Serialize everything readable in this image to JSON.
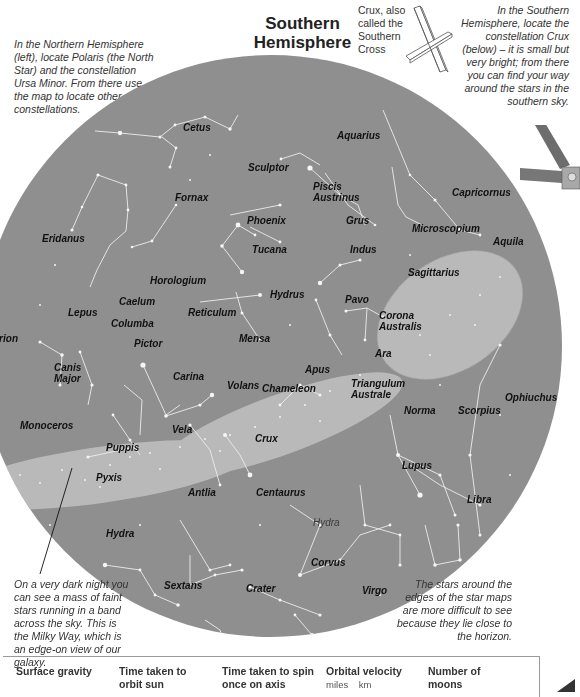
{
  "page": {
    "title": "Southern Hemisphere",
    "intro_left": "In the Northern Hemisphere (left), locate Polaris (the North Star) and the constellation Ursa Minor. From there use the map to locate other constellations.",
    "crux_caption": "Crux, also called the Southern Cross",
    "intro_right": "In the Southern Hemisphere, locate the constellation Crux (below) – it is small but very bright; from there you can find your way around the stars in the southern sky.",
    "note_milky_way": "On a very dark night you can see a mass of faint stars running in a band across the sky. This is the Milky Way, which is an edge-on view of our galaxy.",
    "note_horizon": "The stars around the edges of the star maps are more difficult to see because they lie close to the horizon."
  },
  "colors": {
    "sky_disc": "#8f8f8f",
    "star": "#f4f4f4",
    "line": "#e8e8e8",
    "label": "#111111",
    "border": "#999999"
  },
  "constellations": [
    {
      "name": "Cetus",
      "x": 183,
      "y": 122
    },
    {
      "name": "Aquarius",
      "x": 337,
      "y": 130
    },
    {
      "name": "Sculptor",
      "x": 248,
      "y": 162
    },
    {
      "name": "Capricornus",
      "x": 452,
      "y": 187
    },
    {
      "name": "Fornax",
      "x": 175,
      "y": 192
    },
    {
      "name": "Piscis Austrinus",
      "x": 313,
      "y": 181
    },
    {
      "name": "Phoenix",
      "x": 247,
      "y": 215
    },
    {
      "name": "Grus",
      "x": 346,
      "y": 215
    },
    {
      "name": "Microscopium",
      "x": 412,
      "y": 223
    },
    {
      "name": "Eridanus",
      "x": 42,
      "y": 233
    },
    {
      "name": "Tucana",
      "x": 252,
      "y": 244
    },
    {
      "name": "Indus",
      "x": 350,
      "y": 244
    },
    {
      "name": "Aquila",
      "x": 493,
      "y": 236
    },
    {
      "name": "Horologium",
      "x": 150,
      "y": 275
    },
    {
      "name": "Sagittarius",
      "x": 408,
      "y": 267
    },
    {
      "name": "Hydrus",
      "x": 270,
      "y": 289
    },
    {
      "name": "Caelum",
      "x": 119,
      "y": 296
    },
    {
      "name": "Lepus",
      "x": 68,
      "y": 307
    },
    {
      "name": "Reticulum",
      "x": 188,
      "y": 307
    },
    {
      "name": "Pavo",
      "x": 345,
      "y": 294
    },
    {
      "name": "Corona Australis",
      "x": 379,
      "y": 310
    },
    {
      "name": "Columba",
      "x": 111,
      "y": 318
    },
    {
      "name": "Orion",
      "x": -4,
      "y": 333
    },
    {
      "name": "Mensa",
      "x": 239,
      "y": 333
    },
    {
      "name": "Pictor",
      "x": 134,
      "y": 338
    },
    {
      "name": "Ara",
      "x": 375,
      "y": 348
    },
    {
      "name": "Canis Major",
      "x": 54,
      "y": 362
    },
    {
      "name": "Apus",
      "x": 305,
      "y": 364
    },
    {
      "name": "Triangulum Australe",
      "x": 351,
      "y": 378
    },
    {
      "name": "Carina",
      "x": 173,
      "y": 371
    },
    {
      "name": "Volans",
      "x": 227,
      "y": 380
    },
    {
      "name": "Chameleon",
      "x": 262,
      "y": 383
    },
    {
      "name": "Ophiuchus",
      "x": 505,
      "y": 392
    },
    {
      "name": "Norma",
      "x": 404,
      "y": 405
    },
    {
      "name": "Scorpius",
      "x": 458,
      "y": 405
    },
    {
      "name": "Monoceros",
      "x": 20,
      "y": 420
    },
    {
      "name": "Vela",
      "x": 172,
      "y": 424
    },
    {
      "name": "Crux",
      "x": 255,
      "y": 433
    },
    {
      "name": "Puppis",
      "x": 106,
      "y": 442
    },
    {
      "name": "Pyxis",
      "x": 96,
      "y": 472
    },
    {
      "name": "Lupus",
      "x": 402,
      "y": 460
    },
    {
      "name": "Antlia",
      "x": 188,
      "y": 487
    },
    {
      "name": "Centaurus",
      "x": 256,
      "y": 487
    },
    {
      "name": "Libra",
      "x": 467,
      "y": 494
    },
    {
      "name": "Hydra",
      "x": 313,
      "y": 517
    },
    {
      "name": "Hydra",
      "x": 106,
      "y": 528
    },
    {
      "name": "Corvus",
      "x": 311,
      "y": 557
    },
    {
      "name": "Sextans",
      "x": 164,
      "y": 580
    },
    {
      "name": "Crater",
      "x": 246,
      "y": 583
    },
    {
      "name": "Virgo",
      "x": 362,
      "y": 585
    }
  ],
  "table": {
    "columns": [
      {
        "title": "Surface gravity",
        "sub": ""
      },
      {
        "title": "Time taken to orbit sun",
        "sub": ""
      },
      {
        "title": "Time taken to spin once on axis",
        "sub": ""
      },
      {
        "title": "Orbital velocity",
        "sub": "miles    km"
      },
      {
        "title": "Number of moons",
        "sub": ""
      }
    ]
  }
}
